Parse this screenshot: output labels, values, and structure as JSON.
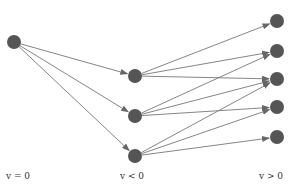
{
  "diagram": {
    "node_color": "#555555",
    "edge_color": "#777777",
    "nodes": [
      {
        "id": "s",
        "x": 14,
        "y": 42
      },
      {
        "id": "m1",
        "x": 135,
        "y": 76
      },
      {
        "id": "m2",
        "x": 135,
        "y": 116
      },
      {
        "id": "m3",
        "x": 135,
        "y": 156
      },
      {
        "id": "r1",
        "x": 277,
        "y": 21
      },
      {
        "id": "r2",
        "x": 277,
        "y": 51
      },
      {
        "id": "r3",
        "x": 277,
        "y": 79
      },
      {
        "id": "r4",
        "x": 277,
        "y": 107
      },
      {
        "id": "r5",
        "x": 277,
        "y": 137
      }
    ],
    "edges": [
      [
        "s",
        "m1"
      ],
      [
        "s",
        "m2"
      ],
      [
        "s",
        "m3"
      ],
      [
        "m1",
        "r1"
      ],
      [
        "m1",
        "r2"
      ],
      [
        "m1",
        "r3"
      ],
      [
        "m2",
        "r2"
      ],
      [
        "m2",
        "r3"
      ],
      [
        "m2",
        "r4"
      ],
      [
        "m3",
        "r3"
      ],
      [
        "m3",
        "r4"
      ],
      [
        "m3",
        "r5"
      ]
    ],
    "labels": {
      "left": "v = 0",
      "middle": "v < 0",
      "right": "v > 0"
    }
  }
}
